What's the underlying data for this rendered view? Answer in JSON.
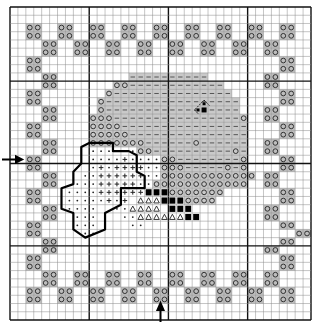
{
  "chart": {
    "cols": 38,
    "rows": 38,
    "major_every": 10,
    "major_col_offset": 0,
    "major_row_offset": 9,
    "colors": {
      "grid_line": "#8a8a8a",
      "major_line": "#111111",
      "border_fill": "#bdbdbd",
      "shade_fill": "#c9c9c9",
      "symbol": "#333333",
      "outline": "#000000"
    },
    "legend": {
      ".": "empty",
      "O": "circle-on-gray (border motif)",
      "-": "dash-on-gray (shaded)",
      "c": "circle-on-gray (shaded)",
      "C": "circle-on-white",
      "d": "dot-on-white",
      "p": "plus-on-white",
      "#": "black-square",
      "t": "triangle-on-white",
      "D": "black-diamond-marker"
    },
    "grid": [
      "......................................",
      "......................................",
      "..OO..OO..OO..OO..OO..OO..OO..OO..OO..",
      "..OO..OO..OO..OO..OO..OO..OO..OO..OO..",
      "....OO..OO..OO..OO..OO..OO..OO..OO....",
      "....OO..OO..OO..OO..OO..OO..OO..OO....",
      "..OO..............................OO..",
      "..OO..............................OO..",
      "....OO.........----------.......OO....",
      "....OO.......cc------------.....OO....",
      "..OO........c---------------......OO..",
      "..OO.......c-----------------.....OO..",
      "....OO.....c------------D----...OO....",
      "....OO....ccc----------------c..OO....",
      "..OO......cccc----------------....OO..",
      "..OO......ccccc---------------....OO..",
      "....OO....ccccccc------c------..OO....",
      "....OO....ddddddcc----------c-..OO....",
      "..OO......ddddpddddcc--------c....OO..",
      "..OO......dpdppppddccc-----c-c....OO..",
      "....OO...ddppppppddcccccccccccc.OO....",
      "....OO..dddpppppddcccccccccccc..OO....",
      "..OO...ddddpppppp###ccccccc.......OO..",
      "..OO...dddddpdp.ttt###cccc........OO..",
      "....OO.dddd..ddtttt.###.........OO....",
      "....OO..ddd...ddtttttt##........OO....",
      "..OO....ddd....dd.................OO..",
      "..OO.....dd.........................OO",
      "....OO............................OO..",
      "....OO..........................OO....",
      "..OO..............................OO..",
      "..OO..............................OO..",
      "....OO..OO..OO..OO..OO..OO..OO..OO....",
      "....OO..OO..OO..OO..OO..OO..OO..OO....",
      "..OO..OO..OO..OO..OO..OO..OO..OO..OO..",
      "..OO..OO..OO..OO..OO..OO..OO..OO..OO..",
      "......................................",
      "......................................"
    ],
    "flower_outline": [
      [
        9,
        18
      ],
      [
        9,
        17
      ],
      [
        10,
        16.5
      ],
      [
        13,
        16.5
      ],
      [
        13,
        17.5
      ],
      [
        15,
        17.5
      ],
      [
        16,
        18
      ],
      [
        16,
        20
      ],
      [
        17,
        20.5
      ],
      [
        17,
        22
      ],
      [
        14,
        22
      ],
      [
        14,
        24
      ],
      [
        12,
        25
      ],
      [
        12,
        27
      ],
      [
        9.5,
        28
      ],
      [
        8,
        27
      ],
      [
        8,
        25
      ],
      [
        6.5,
        24.5
      ],
      [
        6.5,
        22
      ],
      [
        8,
        21.5
      ],
      [
        8,
        20
      ],
      [
        9,
        19
      ]
    ],
    "markers": {
      "left_arrow": {
        "row": 19,
        "direction": "right"
      },
      "bottom_arrow": {
        "col": 19,
        "direction": "up"
      }
    }
  }
}
